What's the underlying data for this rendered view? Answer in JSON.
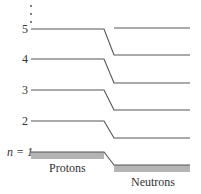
{
  "diagram": {
    "type": "energy-level-diagram",
    "continuation_marker": "⋮",
    "levels": [
      {
        "n": "5",
        "label": "5"
      },
      {
        "n": "4",
        "label": "4"
      },
      {
        "n": "3",
        "label": "3"
      },
      {
        "n": "2",
        "label": "2"
      },
      {
        "n": "1",
        "label": "n = 1"
      }
    ],
    "columns": {
      "left": {
        "label": "Protons"
      },
      "right": {
        "label": "Neutrons"
      }
    },
    "colors": {
      "line": "#555555",
      "fill": "#b4b4b4",
      "text": "#333333"
    }
  }
}
